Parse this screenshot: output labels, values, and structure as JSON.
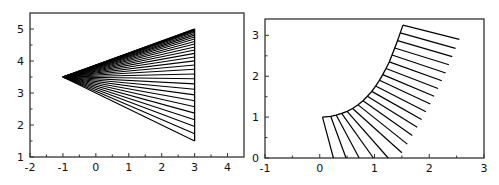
{
  "chart_data": [
    {
      "type": "line",
      "title": "",
      "xlabel": "",
      "ylabel": "",
      "xlim": [
        -2,
        4.5
      ],
      "ylim": [
        1,
        5.5
      ],
      "xticks": [
        -2,
        -1,
        0,
        1,
        2,
        3,
        4
      ],
      "yticks": [
        1,
        2,
        3,
        4,
        5
      ],
      "grid": false,
      "legend": null,
      "description": "Fan of line segments from apex (-1, 3.5) to points on x=3 between y=1.5 and y=5, crowded toward the top",
      "apex": [
        -1,
        3.5
      ],
      "targets_x": 3,
      "targets_y": [
        1.5,
        1.73,
        1.95,
        2.165,
        2.372,
        2.569,
        2.76,
        2.942,
        3.117,
        3.285,
        3.444,
        3.596,
        3.74,
        3.876,
        4.004,
        4.125,
        4.238,
        4.343,
        4.44,
        4.53,
        4.611,
        4.685,
        4.751,
        4.809,
        4.86,
        4.903,
        4.938,
        4.965,
        4.984,
        4.996,
        5.0
      ],
      "edge_segment": [
        [
          3,
          1.5
        ],
        [
          3,
          5
        ]
      ]
    },
    {
      "type": "line",
      "title": "",
      "xlabel": "",
      "ylabel": "",
      "xlim": [
        -1,
        3
      ],
      "ylim": [
        0,
        3.4
      ],
      "xticks": [
        -1,
        0,
        1,
        2,
        3
      ],
      "yticks": [
        0,
        1,
        2,
        3
      ],
      "grid": false,
      "legend": null,
      "description": "Curve from (0.05,1) to (1.52,3.25) with line segments emanating from points on the curve, rotating from downward to rightward",
      "curve": [
        [
          0.05,
          1.0
        ],
        [
          0.2,
          1.02
        ],
        [
          0.3,
          1.05
        ],
        [
          0.4,
          1.09
        ],
        [
          0.5,
          1.14
        ],
        [
          0.6,
          1.21
        ],
        [
          0.7,
          1.3
        ],
        [
          0.79,
          1.4
        ],
        [
          0.87,
          1.51
        ],
        [
          0.95,
          1.63
        ],
        [
          1.02,
          1.76
        ],
        [
          1.09,
          1.9
        ],
        [
          1.15,
          2.04
        ],
        [
          1.21,
          2.19
        ],
        [
          1.27,
          2.35
        ],
        [
          1.32,
          2.52
        ],
        [
          1.37,
          2.69
        ],
        [
          1.42,
          2.87
        ],
        [
          1.47,
          3.06
        ],
        [
          1.52,
          3.25
        ]
      ],
      "segment_ends": [
        [
          0.25,
          0
        ],
        [
          0.48,
          0
        ],
        [
          0.72,
          0
        ],
        [
          0.98,
          0
        ],
        [
          1.25,
          0
        ],
        [
          1.5,
          0.13
        ],
        [
          1.6,
          0.34
        ],
        [
          1.69,
          0.55
        ],
        [
          1.78,
          0.75
        ],
        [
          1.86,
          0.94
        ],
        [
          1.94,
          1.13
        ],
        [
          2.02,
          1.32
        ],
        [
          2.09,
          1.51
        ],
        [
          2.16,
          1.7
        ],
        [
          2.23,
          1.89
        ],
        [
          2.3,
          2.08
        ],
        [
          2.36,
          2.28
        ],
        [
          2.42,
          2.48
        ],
        [
          2.48,
          2.68
        ],
        [
          2.55,
          2.9
        ]
      ]
    }
  ],
  "panels": [
    {
      "xticks": [
        "-2",
        "-1",
        "0",
        "1",
        "2",
        "3",
        "4"
      ],
      "yticks": [
        "1",
        "2",
        "3",
        "4",
        "5"
      ]
    },
    {
      "xticks": [
        "-1",
        "0",
        "1",
        "2",
        "3"
      ],
      "yticks": [
        "0",
        "1",
        "2",
        "3"
      ]
    }
  ],
  "style": {
    "line_color": "#000000",
    "axis_color": "#333333",
    "background": "#ffffff"
  }
}
